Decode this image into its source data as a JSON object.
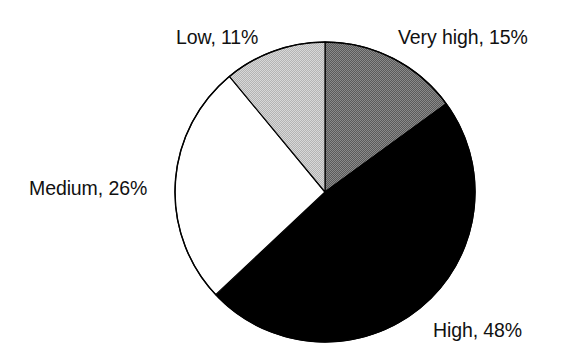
{
  "chart_data": {
    "type": "pie",
    "title": "",
    "subtitle": "",
    "xlabel": "",
    "ylabel": "",
    "grid": false,
    "legend_position": "none",
    "label_format": "{name}, {value}%",
    "start_angle_deg": 0,
    "direction": "clockwise",
    "total": 100,
    "units": "%",
    "categories": [
      "Very high",
      "High",
      "Medium",
      "Low"
    ],
    "values": [
      15,
      48,
      26,
      11
    ],
    "slices": [
      {
        "name": "Very high",
        "value": 15,
        "label": "Very high, 15%",
        "fill": "#6e6e6e",
        "pattern": "dither-dark-gray",
        "stroke": "#000000",
        "start_deg": 0,
        "end_deg": 54
      },
      {
        "name": "High",
        "value": 48,
        "label": "High, 48%",
        "fill": "#000000",
        "pattern": "solid-black",
        "stroke": "#000000",
        "start_deg": 54,
        "end_deg": 226.8
      },
      {
        "name": "Medium",
        "value": 26,
        "label": "Medium, 26%",
        "fill": "#ffffff",
        "pattern": "solid-white",
        "stroke": "#000000",
        "start_deg": 226.8,
        "end_deg": 320.4
      },
      {
        "name": "Low",
        "value": 11,
        "label": "Low, 11%",
        "fill": "#c4c4c4",
        "pattern": "dither-light-gray",
        "stroke": "#000000",
        "start_deg": 320.4,
        "end_deg": 360
      }
    ],
    "geometry": {
      "center_x": 325,
      "center_y": 192,
      "radius": 150
    },
    "colors": {
      "background": "#ffffff",
      "text": "#111111",
      "outline": "#000000"
    }
  }
}
